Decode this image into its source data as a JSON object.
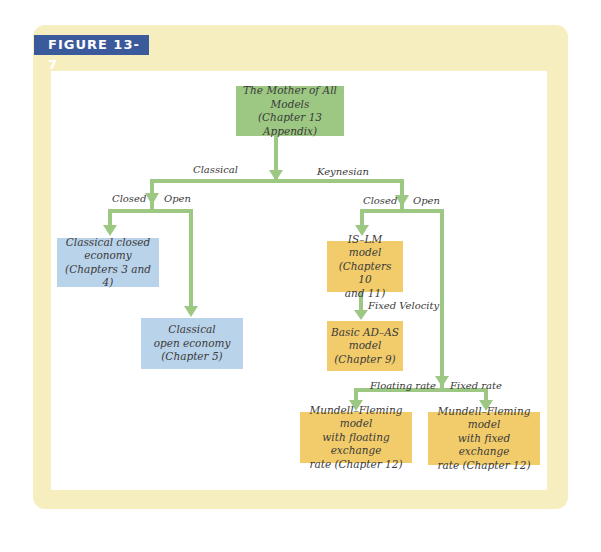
{
  "figure": {
    "label": "FIGURE 13-7",
    "colors": {
      "frame": "#f7eec0",
      "label_bg": "#3a5a9c",
      "root_box": "#9dc883",
      "classical_box": "#b9d3ea",
      "keynesian_box": "#f2cc6a",
      "arrow": "#9dc883"
    }
  },
  "nodes": {
    "root": {
      "line1": "The Mother of All Models",
      "line2": "(Chapter 13 Appendix)"
    },
    "classical_closed": {
      "line1": "Classical closed",
      "line2": "economy",
      "line3": "(Chapters 3 and 4)"
    },
    "classical_open": {
      "line1": "Classical",
      "line2": "open economy",
      "line3": "(Chapter 5)"
    },
    "islm": {
      "line1": "IS–LM model",
      "line2": "(Chapters 10",
      "line3": "and 11)"
    },
    "adas": {
      "line1": "Basic AD–AS",
      "line2": "model",
      "line3": "(Chapter 9)"
    },
    "mf_floating": {
      "line1": "Mundell–Fleming model",
      "line2": "with floating exchange",
      "line3": "rate (Chapter 12)"
    },
    "mf_fixed": {
      "line1": "Mundell–Fleming model",
      "line2": "with fixed exchange",
      "line3": "rate (Chapter 12)"
    }
  },
  "edge_labels": {
    "classical": "Classical",
    "keynesian": "Keynesian",
    "classical_closed": "Closed",
    "classical_open": "Open",
    "keynesian_closed": "Closed",
    "keynesian_open": "Open",
    "fixed_velocity": "Fixed Velocity",
    "floating_rate": "Floating rate",
    "fixed_rate": "Fixed rate"
  }
}
